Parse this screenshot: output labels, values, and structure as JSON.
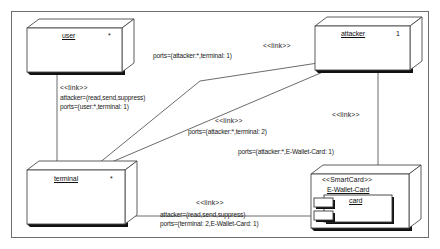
{
  "diagram": {
    "type": "uml-deployment-diagram",
    "frame": {
      "label": ""
    },
    "nodes": [
      {
        "id": "user",
        "name": "user",
        "multiplicity": "*",
        "stereotype": ""
      },
      {
        "id": "attacker",
        "name": "attacker",
        "multiplicity": "1",
        "stereotype": ""
      },
      {
        "id": "terminal",
        "name": "terminal",
        "multiplicity": "*",
        "stereotype": ""
      },
      {
        "id": "ewallet",
        "name": "E-Wallet-Card",
        "multiplicity": "",
        "stereotype": "<<SmartCard>>",
        "inner_component": "card"
      }
    ],
    "links": [
      {
        "id": "user-terminal",
        "stereotype": "<<link>>",
        "attacker_attr": "attacker=(read,send,suppress)",
        "ports_attr": "ports=(user:*,terminal: 1)"
      },
      {
        "id": "attacker-terminal-1",
        "stereotype": "<<link>>",
        "attacker_attr": "",
        "ports_attr": "ports=(attacker:*,terminal: 1)"
      },
      {
        "id": "attacker-terminal-2",
        "stereotype": "<<link>>",
        "attacker_attr": "",
        "ports_attr": "ports=(attacker:*,terminal: 2)"
      },
      {
        "id": "attacker-ewallet",
        "stereotype": "<<link>>",
        "attacker_attr": "",
        "ports_attr": "ports=(attacker:*,E-Wallet-Card: 1)"
      },
      {
        "id": "terminal-ewallet",
        "stereotype": "<<link>>",
        "attacker_attr": "attacker=(read,send,suppress)",
        "ports_attr": "ports=(terminal: 2,E-Wallet-Card: 1)"
      }
    ],
    "colors": {
      "stroke": "#3a3a3a",
      "shadow": "#111111",
      "fill": "#ffffff",
      "frame": "#6b6b6b"
    }
  }
}
